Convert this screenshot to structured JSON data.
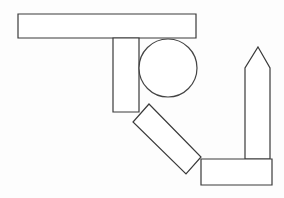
{
  "canvas": {
    "width": 284,
    "height": 198,
    "background_color": "#fdfdfd",
    "stroke_color": "#3a3a3a",
    "fill_color": "#ffffff",
    "stroke_width": 1.2,
    "title": "Geometric line drawing of overlapping outlined shapes"
  },
  "shapes": [
    {
      "id": "horizontal-bar",
      "kind": "rectangle",
      "label": "long horizontal bar",
      "x": 18,
      "y": 14,
      "width": 178,
      "height": 24,
      "points": "18,14 196,14 196,38 18,38"
    },
    {
      "id": "vertical-bar",
      "kind": "rectangle",
      "label": "upright vertical bar",
      "x": 113,
      "y": 38,
      "width": 26,
      "height": 74,
      "points": "113,38 139,38 139,112 113,112"
    },
    {
      "id": "circle",
      "kind": "circle",
      "label": "circle",
      "cx": 168,
      "cy": 68,
      "r": 29
    },
    {
      "id": "diagonal-bar",
      "kind": "rotated-rectangle",
      "label": "diagonal tilted bar",
      "points": "149,104 201,157 186,174 133,122",
      "rotation_deg": 45
    },
    {
      "id": "bottom-bar",
      "kind": "rectangle",
      "label": "bottom right horizontal bar",
      "x": 201,
      "y": 159,
      "width": 71,
      "height": 26,
      "points": "201,159 272,159 272,185 201,185"
    },
    {
      "id": "obelisk",
      "kind": "pentagon",
      "label": "obelisk / pointed tower",
      "points": "258,47 270,68 270,159 245,159 245,68"
    }
  ]
}
